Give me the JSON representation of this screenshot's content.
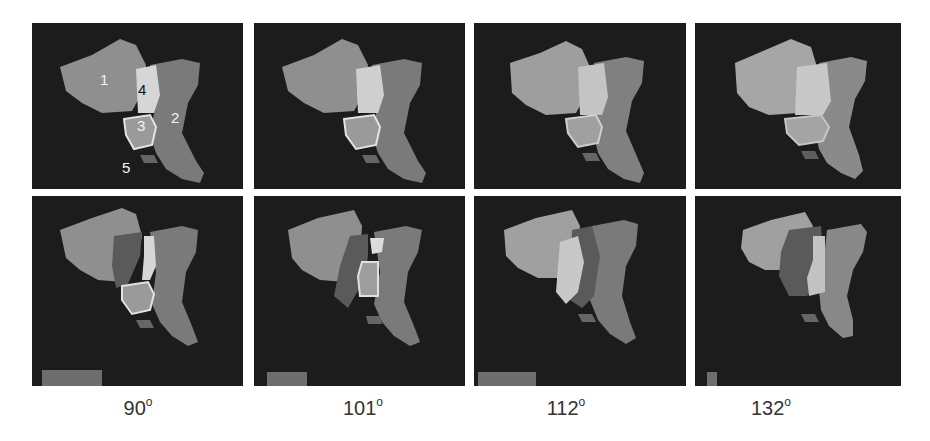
{
  "figure": {
    "columns": [
      {
        "angle": "90",
        "unit": "o"
      },
      {
        "angle": "101",
        "unit": "o"
      },
      {
        "angle": "112",
        "unit": "o"
      },
      {
        "angle": "132",
        "unit": "o"
      }
    ],
    "region_labels": [
      "1",
      "2",
      "3",
      "4",
      "5"
    ],
    "colors": {
      "background": "#1c1c1c",
      "region1": "#8f8f8f",
      "region2": "#7a7a7a",
      "region3": "#9a9a9a",
      "region4": "#d6d6d6",
      "region5": "#666666",
      "overlay": "#5a5a5a"
    }
  }
}
